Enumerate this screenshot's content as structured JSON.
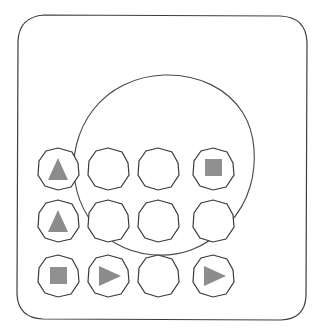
{
  "panel": {
    "title": "Device Control Panel",
    "description": "Hand-drawn sketch of a rounded rectangular device face with a large circular dial outline overlaying a 4 by 3 grid of round buttons",
    "background_color": "#ffffff",
    "outline_color": "#3a3a3a",
    "glyph_color": "#8c8c8c",
    "glyph_color_dark": "#7d7d7d"
  },
  "device_body": {
    "name": "device-body",
    "shape": "rounded-rectangle",
    "x": 17,
    "y": 15,
    "width": 290,
    "height": 305,
    "corner_radius": 26
  },
  "dial_ring": {
    "name": "dial-ring",
    "shape": "circle",
    "center_x": 164,
    "center_y": 165,
    "radius": 90
  },
  "grid": {
    "columns": 4,
    "rows": 3,
    "button_radius": 21,
    "column_centers": [
      58,
      108,
      158,
      213
    ],
    "row_centers": [
      169,
      221,
      276
    ]
  },
  "buttons": [
    {
      "id": "btn-r1-c1",
      "name": "button-up-1",
      "row": 0,
      "col": 0,
      "icon": "triangle-up-icon",
      "label": "Up",
      "has_icon": true
    },
    {
      "id": "btn-r1-c2",
      "name": "button-blank-r1-c2",
      "row": 0,
      "col": 1,
      "icon": "none",
      "label": "",
      "has_icon": false
    },
    {
      "id": "btn-r1-c3",
      "name": "button-blank-r1-c3",
      "row": 0,
      "col": 2,
      "icon": "none",
      "label": "",
      "has_icon": false
    },
    {
      "id": "btn-r1-c4",
      "name": "button-stop-1",
      "row": 0,
      "col": 3,
      "icon": "square-stop-icon",
      "label": "Stop",
      "has_icon": true
    },
    {
      "id": "btn-r2-c1",
      "name": "button-up-2",
      "row": 1,
      "col": 0,
      "icon": "triangle-up-icon",
      "label": "Up",
      "has_icon": true
    },
    {
      "id": "btn-r2-c2",
      "name": "button-blank-r2-c2",
      "row": 1,
      "col": 1,
      "icon": "none",
      "label": "",
      "has_icon": false
    },
    {
      "id": "btn-r2-c3",
      "name": "button-blank-r2-c3",
      "row": 1,
      "col": 2,
      "icon": "none",
      "label": "",
      "has_icon": false
    },
    {
      "id": "btn-r2-c4",
      "name": "button-blank-r2-c4",
      "row": 1,
      "col": 3,
      "icon": "none",
      "label": "",
      "has_icon": false
    },
    {
      "id": "btn-r3-c1",
      "name": "button-stop-2",
      "row": 2,
      "col": 0,
      "icon": "square-stop-icon",
      "label": "Stop",
      "has_icon": true
    },
    {
      "id": "btn-r3-c2",
      "name": "button-play-1",
      "row": 2,
      "col": 1,
      "icon": "triangle-play-icon",
      "label": "Play",
      "has_icon": true
    },
    {
      "id": "btn-r3-c3",
      "name": "button-blank-r3-c3",
      "row": 2,
      "col": 2,
      "icon": "none",
      "label": "",
      "has_icon": false
    },
    {
      "id": "btn-r3-c4",
      "name": "button-play-2",
      "row": 2,
      "col": 3,
      "icon": "triangle-play-icon",
      "label": "Play",
      "has_icon": true
    }
  ]
}
